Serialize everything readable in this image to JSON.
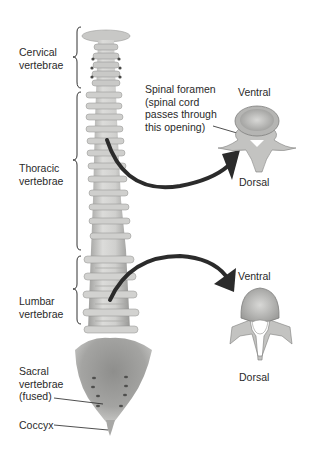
{
  "diagram": {
    "title": "",
    "regions": [
      {
        "id": "cervical",
        "line1": "Cervical",
        "line2": "vertebrae"
      },
      {
        "id": "thoracic",
        "line1": "Thoracic",
        "line2": "vertebrae"
      },
      {
        "id": "lumbar",
        "line1": "Lumbar",
        "line2": "vertebrae"
      },
      {
        "id": "sacral",
        "line1": "Sacral",
        "line2": "vertebrae",
        "line3": "(fused)"
      },
      {
        "id": "coccyx",
        "line1": "Coccyx"
      }
    ],
    "callout": {
      "line1": "Spinal foramen",
      "line2": "(spinal cord",
      "line3": "passes through",
      "line4": "this opening)"
    },
    "thoracic_detail": {
      "top_label": "Ventral",
      "bottom_label": "Dorsal"
    },
    "lumbar_detail": {
      "top_label": "Ventral",
      "bottom_label": "Dorsal"
    },
    "colors": {
      "bone_light": "#e2e2e0",
      "bone_mid": "#b8b8b6",
      "bone_dark": "#8c8c8a",
      "arrow": "#2b2b2b",
      "text": "#2a2a2a"
    }
  }
}
